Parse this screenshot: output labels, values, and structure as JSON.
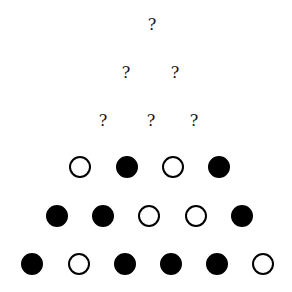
{
  "diagram": {
    "unknown_rows": [
      {
        "row": 1,
        "items": [
          {
            "label": "?",
            "x": 152,
            "y": 25
          }
        ]
      },
      {
        "row": 2,
        "items": [
          {
            "label": "?",
            "x": 126,
            "y": 73
          },
          {
            "label": "?",
            "x": 175,
            "y": 73
          }
        ]
      },
      {
        "row": 3,
        "items": [
          {
            "label": "?",
            "x": 103,
            "y": 121
          },
          {
            "label": "?",
            "x": 151,
            "y": 121
          },
          {
            "label": "?",
            "x": 194,
            "y": 121
          }
        ]
      }
    ],
    "circle_rows": [
      {
        "row": 4,
        "y": 167,
        "circles": [
          {
            "state": "open",
            "x": 80
          },
          {
            "state": "filled",
            "x": 127
          },
          {
            "state": "open",
            "x": 173
          },
          {
            "state": "filled",
            "x": 219
          }
        ]
      },
      {
        "row": 5,
        "y": 216,
        "circles": [
          {
            "state": "filled",
            "x": 57
          },
          {
            "state": "filled",
            "x": 103
          },
          {
            "state": "open",
            "x": 149
          },
          {
            "state": "open",
            "x": 196
          },
          {
            "state": "filled",
            "x": 242
          }
        ]
      },
      {
        "row": 6,
        "y": 264,
        "circles": [
          {
            "state": "filled",
            "x": 32
          },
          {
            "state": "open",
            "x": 79
          },
          {
            "state": "filled",
            "x": 125
          },
          {
            "state": "filled",
            "x": 171
          },
          {
            "state": "filled",
            "x": 217
          },
          {
            "state": "open",
            "x": 263
          }
        ]
      }
    ],
    "colors": {
      "filled": "#000000",
      "open_fill": "#ffffff",
      "stroke": "#000000",
      "background": "#ffffff"
    }
  }
}
